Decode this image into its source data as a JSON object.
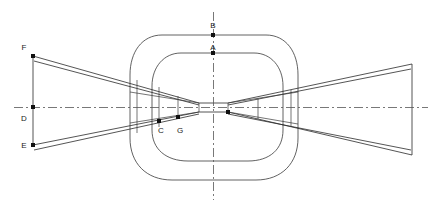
{
  "drawing": {
    "title": "Bowtie profile with concentric oval housing",
    "background_color": "#ffffff",
    "line_color": "#2a2a2a",
    "centerline_color": "#555555",
    "point_color": "#111111",
    "width": 434,
    "height": 215,
    "labels": [
      {
        "id": "B",
        "text": "B",
        "x": 213,
        "y": 27,
        "point_x": 222,
        "point_y": 35
      },
      {
        "id": "A",
        "text": "A",
        "x": 213,
        "y": 50,
        "point_x": 222,
        "point_y": 53
      },
      {
        "id": "F",
        "text": "F",
        "x": 24,
        "y": 50,
        "point_x": 33,
        "point_y": 56
      },
      {
        "id": "D",
        "text": "D",
        "x": 24,
        "y": 120,
        "point_x": 33,
        "point_y": 108
      },
      {
        "id": "E",
        "text": "E",
        "x": 24,
        "y": 148,
        "point_x": 33,
        "point_y": 145
      },
      {
        "id": "C",
        "text": "C",
        "x": 161,
        "y": 133,
        "point_x": 159,
        "point_y": 121
      },
      {
        "id": "G",
        "text": "G",
        "x": 180,
        "y": 133,
        "point_x": 178,
        "point_y": 117
      }
    ],
    "geometry": {
      "center_x": 213,
      "center_y": 107,
      "outer_oval": {
        "left": 130,
        "right": 298,
        "top": 35,
        "bottom": 180
      },
      "inner_oval": {
        "left": 152,
        "right": 283,
        "top": 53,
        "bottom": 161
      },
      "left_edge_x": 33,
      "right_edge_x": 412,
      "waist_left": 199,
      "waist_right": 228,
      "waist_top": 103,
      "waist_bottom": 112
    }
  }
}
